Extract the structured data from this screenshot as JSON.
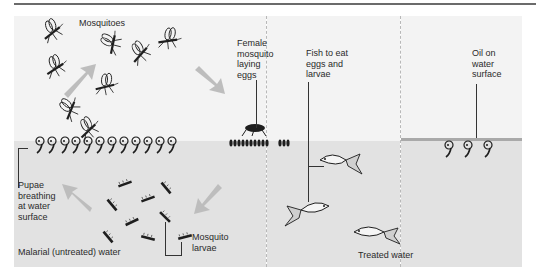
{
  "diagram": {
    "panels": [
      {
        "id": "untreated",
        "caption": "Malarial (untreated) water"
      },
      {
        "id": "treated-fish",
        "caption": "Treated water"
      },
      {
        "id": "treated-oil",
        "caption": ""
      }
    ],
    "labels": {
      "mosquitoes": "Mosquitoes",
      "female_laying": "Female\nmosquito\nlaying\neggs",
      "pupae": "Pupae\nbreathing\nat water\nsurface",
      "larvae": "Mosquito\nlarvae",
      "untreated_water": "Malarial (untreated) water",
      "fish": "Fish to eat\neggs and\nlarvae",
      "treated_water": "Treated water",
      "oil": "Oil on\nwater\nsurface"
    },
    "cycle_arrows": [
      "larvae-to-pupae",
      "pupae-to-adults",
      "adults-to-egg-laying",
      "eggs-to-larvae"
    ],
    "counts": {
      "flying_mosquitoes": 9,
      "pupae_untreated": 12,
      "larvae_untreated": 10,
      "fish": 3,
      "pupae_under_oil": 3
    },
    "colors": {
      "air": "#f3f3f3",
      "water": "#e2e2e2",
      "arrow": "#bdbdbd",
      "oil": "#a9a9a9",
      "ink": "#1e1e1e"
    }
  }
}
